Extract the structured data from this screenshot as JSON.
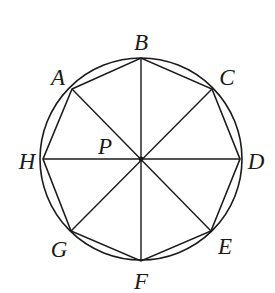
{
  "diagram": {
    "type": "geometry",
    "colors": {
      "stroke": "#1a1a1a",
      "background": "#ffffff"
    },
    "circle": {
      "cx": 141,
      "cy": 159,
      "r": 101
    },
    "center": {
      "label": "P",
      "x": 141,
      "y": 159,
      "label_x": 105,
      "label_y": 154
    },
    "vertices": [
      {
        "label": "A",
        "x": 72,
        "y": 89,
        "label_x": 58,
        "label_y": 85
      },
      {
        "label": "B",
        "x": 141,
        "y": 58,
        "label_x": 141,
        "label_y": 50
      },
      {
        "label": "C",
        "x": 212,
        "y": 89,
        "label_x": 227,
        "label_y": 85
      },
      {
        "label": "D",
        "x": 240,
        "y": 159,
        "label_x": 256,
        "label_y": 169
      },
      {
        "label": "E",
        "x": 211,
        "y": 231,
        "label_x": 225,
        "label_y": 254
      },
      {
        "label": "F",
        "x": 141,
        "y": 261,
        "label_x": 141,
        "label_y": 289
      },
      {
        "label": "G",
        "x": 71,
        "y": 231,
        "label_x": 59,
        "label_y": 257
      },
      {
        "label": "H",
        "x": 43,
        "y": 159,
        "label_x": 27,
        "label_y": 169
      }
    ],
    "diameters": [
      [
        "A",
        "E"
      ],
      [
        "B",
        "F"
      ],
      [
        "C",
        "G"
      ],
      [
        "D",
        "H"
      ]
    ]
  }
}
